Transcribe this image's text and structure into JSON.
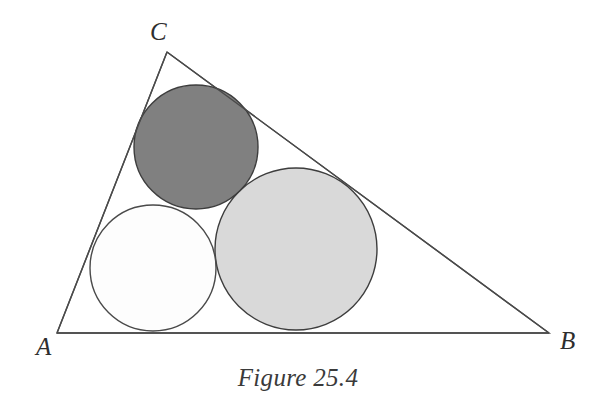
{
  "figure": {
    "caption": "Figure 25.4",
    "background_color": "#ffffff",
    "stroke_color": "#4a4a4a",
    "label_color": "#2e2e2e"
  },
  "labels": {
    "vertex_a": "A",
    "vertex_b": "B",
    "vertex_c": "C"
  },
  "chart_data": {
    "type": "diagram",
    "title": "Figure 25.4",
    "triangle": {
      "name": "triangle-ABC",
      "vertices": [
        {
          "label": "A",
          "x": 57,
          "y": 333
        },
        {
          "label": "B",
          "x": 549,
          "y": 333
        },
        {
          "label": "C",
          "x": 167,
          "y": 52
        }
      ],
      "sides": [
        "AB",
        "BC",
        "CA"
      ],
      "stroke": "#4a4a4a",
      "stroke_width": 1.4,
      "fill": "none"
    },
    "circles": [
      {
        "name": "dark-circle",
        "cx": 196,
        "cy": 147,
        "r": 62,
        "fill": "#808080",
        "stroke": "#3d3d3d",
        "stroke_width": 1.4,
        "tangent_to": [
          "CA",
          "CB",
          "white-circle",
          "light-circle"
        ]
      },
      {
        "name": "white-circle",
        "cx": 153,
        "cy": 268,
        "r": 63,
        "fill": "#fdfdfd",
        "stroke": "#4a4a4a",
        "stroke_width": 1.4,
        "tangent_to": [
          "CA",
          "AB",
          "dark-circle",
          "light-circle"
        ]
      },
      {
        "name": "light-circle",
        "cx": 296,
        "cy": 249,
        "r": 81,
        "fill": "#d9d9d9",
        "stroke": "#3d3d3d",
        "stroke_width": 1.4,
        "tangent_to": [
          "AB",
          "CB",
          "dark-circle",
          "white-circle"
        ]
      }
    ],
    "label_positions": [
      {
        "label": "A",
        "x": 36,
        "y": 355
      },
      {
        "label": "B",
        "x": 560,
        "y": 349
      },
      {
        "label": "C",
        "x": 150,
        "y": 40
      }
    ],
    "caption_position": {
      "x": 298,
      "y": 386
    }
  }
}
